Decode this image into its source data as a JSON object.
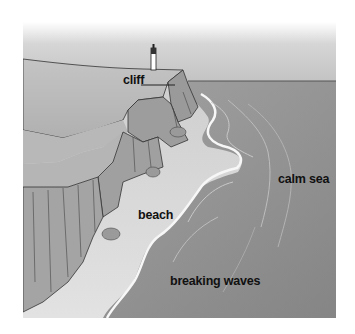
{
  "diagram": {
    "type": "labeled-illustration",
    "labels": {
      "cliff": "cliff",
      "beach": "beach",
      "breaking_waves": "breaking waves",
      "calm_sea": "calm sea"
    },
    "elements": [
      "lighthouse",
      "cliff",
      "beach",
      "breaking waves",
      "calm sea",
      "horizon",
      "rocks"
    ],
    "colors": {
      "sky_top": "#ffffff",
      "sky": "#c8c8c8",
      "land_top": "#bdbdbd",
      "cliff_face": "#9a9a9a",
      "beach": "#d9d9d9",
      "sea": "#8e8e8e",
      "surf": "#f2f2f2",
      "outline": "#333333"
    }
  }
}
